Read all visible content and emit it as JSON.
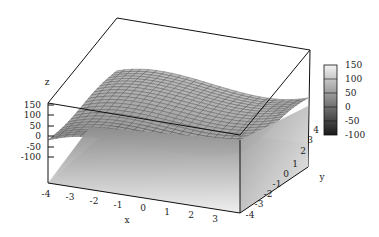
{
  "chart_data": {
    "type": "surface3d",
    "title": "",
    "xlabel": "x",
    "ylabel": "y",
    "zlabel": "z",
    "xlim": [
      -4,
      4
    ],
    "ylim": [
      -4,
      4
    ],
    "zlim": [
      -150,
      150
    ],
    "x_ticks": [
      "-4",
      "-3",
      "-2",
      "-1",
      "0",
      "1",
      "2",
      "3"
    ],
    "y_ticks": [
      "-4",
      "-3",
      "-2",
      "-1",
      "0",
      "1",
      "2",
      "3",
      "4"
    ],
    "z_ticks": [
      "150",
      "100",
      "50",
      "0",
      "-50",
      "-100"
    ],
    "colorbar": {
      "ticks": [
        "150",
        "100",
        "50",
        "0",
        "-50",
        "-100"
      ],
      "range": [
        -100,
        150
      ],
      "colormap": "gray"
    },
    "surface": {
      "description": "Wavy gray mesh surface (approx. cubic-like in x) spanning x,y in [-4,4], z roughly in [0,120], with projected gray shaded floor below",
      "grid": "24x24 mesh",
      "color": "#a0a0a0",
      "mesh_color": "#4a4a4a"
    },
    "grid": false,
    "legend_position": "right"
  },
  "axes": {
    "x_label": "x",
    "y_label": "y",
    "z_label": "z"
  }
}
